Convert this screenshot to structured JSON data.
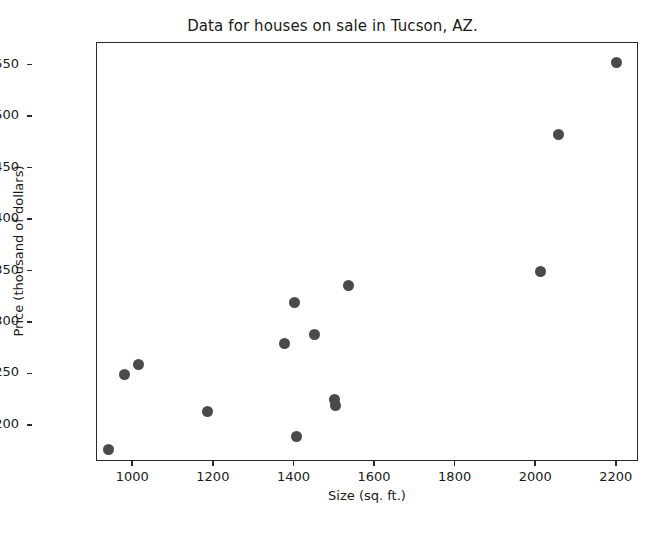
{
  "chart_data": {
    "type": "scatter",
    "title": "Data for houses on sale in Tucson, AZ.",
    "xlabel": "Size (sq. ft.)",
    "ylabel": "Price (thousand of dollars)",
    "xlim": [
      910,
      2255
    ],
    "ylim": [
      165,
      572
    ],
    "xticks": [
      1000,
      1200,
      1400,
      1600,
      1800,
      2000,
      2200
    ],
    "xtick_labels": [
      "1000",
      "1200",
      "1400",
      "1600",
      "1800",
      "2000",
      "2200"
    ],
    "yticks": [
      200,
      250,
      300,
      350,
      400,
      450,
      500,
      550
    ],
    "ytick_labels": [
      "200",
      "250",
      "300",
      "350",
      "400",
      "450",
      "500",
      "550"
    ],
    "grid": false,
    "legend": null,
    "marker_color": "#4a4a4a",
    "marker_size": 11,
    "x": [
      938,
      978,
      1012,
      1185,
      1375,
      1400,
      1405,
      1450,
      1500,
      1502,
      1535,
      2010,
      2055,
      2200
    ],
    "y": [
      177,
      250,
      260,
      214,
      280,
      320,
      190,
      289,
      226,
      220,
      336,
      350,
      483,
      553
    ],
    "points": [
      {
        "x": 938,
        "y": 177
      },
      {
        "x": 978,
        "y": 250
      },
      {
        "x": 1012,
        "y": 260
      },
      {
        "x": 1185,
        "y": 214
      },
      {
        "x": 1375,
        "y": 280
      },
      {
        "x": 1400,
        "y": 320
      },
      {
        "x": 1405,
        "y": 190
      },
      {
        "x": 1450,
        "y": 289
      },
      {
        "x": 1500,
        "y": 226
      },
      {
        "x": 1502,
        "y": 220
      },
      {
        "x": 1535,
        "y": 336
      },
      {
        "x": 2010,
        "y": 350
      },
      {
        "x": 2055,
        "y": 483
      },
      {
        "x": 2200,
        "y": 553
      }
    ]
  }
}
